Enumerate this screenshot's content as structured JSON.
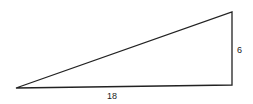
{
  "diagram": {
    "type": "right-triangle",
    "vertices": {
      "bottom_left": [
        16,
        88
      ],
      "bottom_right": [
        232,
        85
      ],
      "top_right": [
        232,
        12
      ]
    },
    "labels": {
      "vertical_side": "6",
      "horizontal_side": "18"
    },
    "stroke_color": "#222222"
  }
}
